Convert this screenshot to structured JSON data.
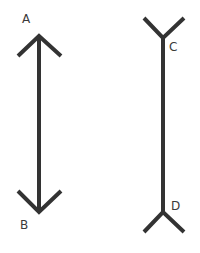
{
  "diagram": {
    "stroke_color": "#333333",
    "label_color": "#3a3a3a",
    "background": "#ffffff",
    "figures": [
      {
        "id": "AB",
        "type": "arrowheads-inward",
        "top_label": "A",
        "bottom_label": "B",
        "shaft": {
          "x": 39,
          "y1": 36,
          "y2": 212
        }
      },
      {
        "id": "CD",
        "type": "arrowheads-outward",
        "top_label": "C",
        "bottom_label": "D",
        "shaft": {
          "x": 163,
          "y1": 38,
          "y2": 212
        }
      }
    ]
  }
}
